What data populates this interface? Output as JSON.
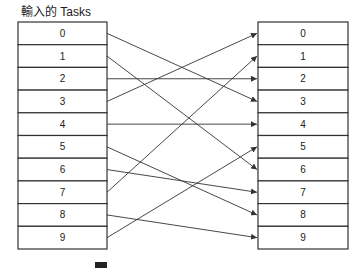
{
  "title": "輸入的 Tasks",
  "left_box": {
    "cells": [
      "0",
      "1",
      "2",
      "3",
      "4",
      "5",
      "6",
      "7",
      "8",
      "9"
    ]
  },
  "right_box": {
    "cells": [
      "0",
      "1",
      "2",
      "3",
      "4",
      "5",
      "6",
      "7",
      "8",
      "9"
    ]
  },
  "mapping": [
    {
      "from": 0,
      "to": 3
    },
    {
      "from": 1,
      "to": 6
    },
    {
      "from": 2,
      "to": 2
    },
    {
      "from": 3,
      "to": 0
    },
    {
      "from": 4,
      "to": 4
    },
    {
      "from": 5,
      "to": 8
    },
    {
      "from": 6,
      "to": 7
    },
    {
      "from": 7,
      "to": 1
    },
    {
      "from": 8,
      "to": 9
    },
    {
      "from": 9,
      "to": 5
    }
  ],
  "colors": {
    "stroke": "#333333",
    "text": "#222222",
    "background": "#ffffff"
  }
}
